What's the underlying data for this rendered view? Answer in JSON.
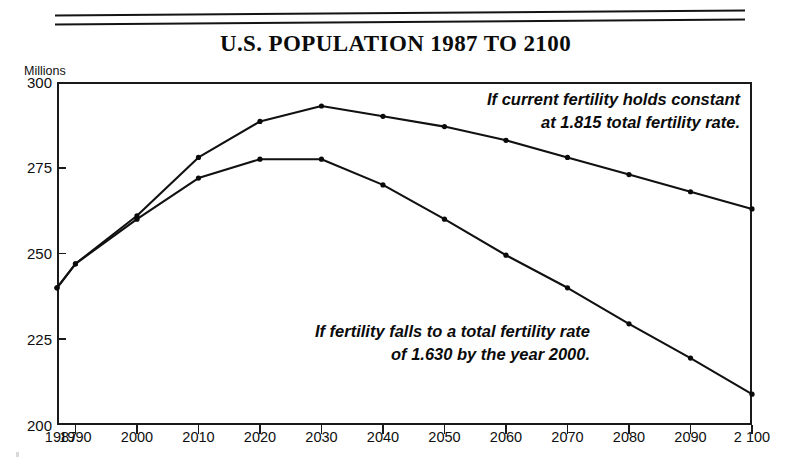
{
  "chart": {
    "title": "U.S. POPULATION 1987 TO 2100",
    "y_axis_unit": "Millions"
  },
  "annotations": {
    "upper": {
      "line1": "If current fertility holds constant",
      "line2": "at 1.815 total fertility rate."
    },
    "lower": {
      "line1": "If fertility falls to a total fertility rate",
      "line2": "of 1.630 by the year 2000."
    }
  },
  "axes": {
    "y_ticks": [
      "300",
      "275",
      "250",
      "225",
      "200"
    ],
    "x_ticks": [
      "1987",
      "1990",
      "2000",
      "2010",
      "2020",
      "2030",
      "2040",
      "2050",
      "2060",
      "2070",
      "2080",
      "2090",
      "2100"
    ]
  },
  "chart_data": {
    "type": "line",
    "title": "U.S. POPULATION 1987 TO 2100",
    "xlabel": "",
    "ylabel": "Millions",
    "ylim": [
      200,
      300
    ],
    "xlim": [
      1987,
      2100
    ],
    "grid": false,
    "legend": "annotations-inline",
    "x": [
      1987,
      1990,
      2000,
      2010,
      2020,
      2030,
      2040,
      2050,
      2060,
      2070,
      2080,
      2090,
      2100
    ],
    "series": [
      {
        "name": "If current fertility holds constant at 1.815 total fertility rate.",
        "values": [
          240,
          247,
          261,
          278,
          288.5,
          293,
          290,
          287,
          283,
          278,
          273,
          268,
          263
        ]
      },
      {
        "name": "If fertility falls to a total fertility rate of 1.630 by the year 2000.",
        "values": [
          240,
          247,
          260,
          272,
          277.5,
          277.5,
          270,
          260,
          249.5,
          240,
          229.5,
          219.5,
          209
        ]
      }
    ]
  },
  "colors": {
    "line": "#111111",
    "frame": "#1a1a1a",
    "text": "#0b0b0b",
    "background": "#ffffff"
  }
}
